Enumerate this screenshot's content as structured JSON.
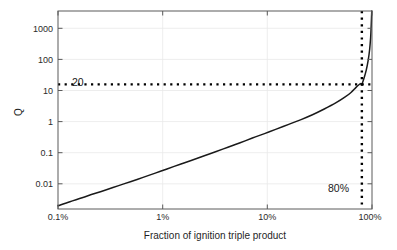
{
  "chart_data": {
    "type": "line",
    "title": "",
    "xlabel": "Fraction of ignition triple product",
    "ylabel": "Q",
    "xscale": "log",
    "yscale": "log",
    "xlim": [
      0.001,
      1.0
    ],
    "ylim": [
      0.004,
      3000
    ],
    "x_tick_labels": [
      "0.1%",
      "1%",
      "10%",
      "100%"
    ],
    "x_tick_values": [
      0.001,
      0.01,
      0.1,
      1.0
    ],
    "y_tick_labels": [
      "1000",
      "100",
      "10",
      "1",
      "0.1",
      "0.01"
    ],
    "y_tick_values": [
      1000,
      100,
      10,
      1,
      0.1,
      0.01
    ],
    "grid": true,
    "legend": "none",
    "series": [
      {
        "name": "Q vs fraction of ignition triple product",
        "x": [
          0.001,
          0.0013,
          0.0017,
          0.0022,
          0.0029,
          0.0038,
          0.005,
          0.0065,
          0.0085,
          0.011,
          0.0145,
          0.019,
          0.025,
          0.032,
          0.042,
          0.055,
          0.072,
          0.094,
          0.12,
          0.16,
          0.21,
          0.27,
          0.35,
          0.45,
          0.55,
          0.63,
          0.7,
          0.75,
          0.78,
          0.8,
          0.84,
          0.88,
          0.92,
          0.95,
          0.97,
          0.98,
          0.99,
          0.995
        ],
        "y": [
          0.005,
          0.0066,
          0.0086,
          0.0113,
          0.0149,
          0.0198,
          0.0263,
          0.0348,
          0.0464,
          0.0618,
          0.0838,
          0.112,
          0.152,
          0.2,
          0.272,
          0.37,
          0.51,
          0.69,
          0.92,
          1.3,
          1.8,
          2.5,
          3.7,
          5.6,
          8.3,
          11.5,
          16.0,
          19.5,
          21.0,
          20.0,
          31.0,
          52.0,
          105.0,
          220.0,
          480.0,
          900.0,
          2000.0,
          3000.0
        ],
        "color": "#1a1a1a",
        "style": "solid"
      }
    ],
    "annotations": [
      {
        "name": "q-twenty-marker",
        "label": "20",
        "kind": "horizontal-line",
        "value": 20,
        "style": "dotted",
        "color": "#000000"
      },
      {
        "name": "eighty-percent-marker",
        "label": "80%",
        "kind": "vertical-line",
        "value": 0.8,
        "style": "dotted",
        "color": "#000000"
      }
    ]
  },
  "axes": {
    "x_label": "Fraction of ignition triple product",
    "y_label": "Q",
    "x_ticks": [
      {
        "label": "0.1%"
      },
      {
        "label": "1%"
      },
      {
        "label": "10%"
      },
      {
        "label": "100%"
      }
    ],
    "y_ticks": [
      {
        "label": "1000"
      },
      {
        "label": "100"
      },
      {
        "label": "10"
      },
      {
        "label": "1"
      },
      {
        "label": "0.1"
      },
      {
        "label": "0.01"
      }
    ]
  },
  "annotations": {
    "q_threshold": "20",
    "fraction_threshold": "80%"
  },
  "colors": {
    "curve": "#1a1a1a",
    "axis": "#555555",
    "grid": "#e8e8e8",
    "annotation": "#000000",
    "text": "#222222",
    "background": "#ffffff"
  }
}
